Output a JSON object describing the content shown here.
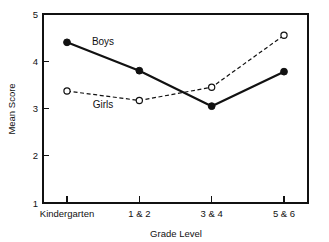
{
  "chart_data": {
    "type": "line",
    "title": "",
    "xlabel": "Grade Level",
    "ylabel": "Mean Score",
    "categories": [
      "Kindergarten",
      "1 & 2",
      "3 & 4",
      "5 & 6"
    ],
    "ylim": [
      1,
      5
    ],
    "yticks": [
      "1",
      "2",
      "3",
      "4",
      "5"
    ],
    "grid": false,
    "legend_position": "inline-annotations",
    "series": [
      {
        "name": "Boys",
        "values": [
          4.4,
          3.8,
          3.05,
          3.78
        ],
        "style": "solid",
        "marker": "filled-circle",
        "color": "#111111",
        "label_x_category_fraction": 0.45,
        "label_value": 4.55
      },
      {
        "name": "Girls",
        "values": [
          3.37,
          3.17,
          3.45,
          4.55
        ],
        "style": "dashed",
        "marker": "open-circle",
        "color": "#111111",
        "label_x_category_fraction": 0.45,
        "label_value": 2.9
      }
    ],
    "annotations": [
      {
        "text": "Boys",
        "x": 103,
        "y": 45
      },
      {
        "text": "Girls",
        "x": 103,
        "y": 108
      }
    ],
    "frame": {
      "left": 43,
      "right": 308,
      "top": 14,
      "bottom": 203
    },
    "colors": {
      "ink": "#111111",
      "background": "#ffffff"
    }
  },
  "axes": {
    "y_title": "Mean Score",
    "x_title": "Grade Level",
    "y_tick_labels": [
      "5",
      "4",
      "3",
      "2",
      "1"
    ],
    "x_tick_labels": [
      "Kindergarten",
      "1 & 2",
      "3 & 4",
      "5 & 6"
    ]
  },
  "series_labels": {
    "boys": "Boys",
    "girls": "Girls"
  }
}
